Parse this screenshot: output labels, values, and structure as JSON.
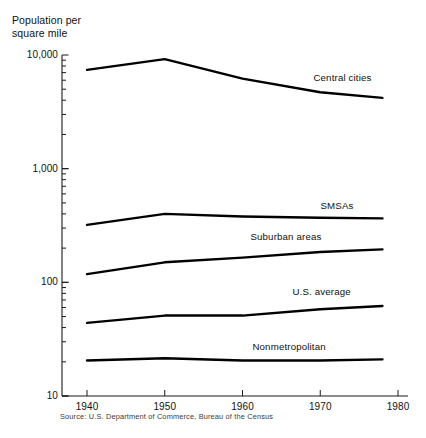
{
  "chart_data": {
    "type": "line",
    "title": "Population per\nsquare mile",
    "xlabel": "",
    "ylabel": "Population per square mile",
    "yscale": "log",
    "ylim": [
      10,
      10000
    ],
    "xlim": [
      1940,
      1980
    ],
    "grid": false,
    "legend_position": "inline-right",
    "x": [
      1940,
      1950,
      1960,
      1970,
      1978
    ],
    "ytick_labels": [
      "10,000",
      "1,000",
      "100",
      "10"
    ],
    "ytick_values": [
      10000,
      1000,
      100,
      10
    ],
    "xtick_labels": [
      "1940",
      "1950",
      "1960",
      "1970",
      "1980"
    ],
    "xtick_values": [
      1940,
      1950,
      1960,
      1970,
      1980
    ],
    "series": [
      {
        "name": "Central cities",
        "label": "Central cities",
        "values": [
          7400,
          9200,
          6200,
          4700,
          4200
        ]
      },
      {
        "name": "SMSAs",
        "label": "SMSAs",
        "values": [
          320,
          400,
          380,
          370,
          365
        ]
      },
      {
        "name": "Suburban areas",
        "label": "Suburban areas",
        "values": [
          118,
          150,
          165,
          185,
          195
        ]
      },
      {
        "name": "U.S. average",
        "label": "U.S. average",
        "values": [
          44,
          51,
          51,
          58,
          62
        ]
      },
      {
        "name": "Nonmetropolitan",
        "label": "Nonmetropolitan",
        "values": [
          20.5,
          21.5,
          20.5,
          20.5,
          21
        ]
      }
    ],
    "source": "Source: U.S. Department of Commerce, Bureau of the Census",
    "line_color": "#000000"
  }
}
